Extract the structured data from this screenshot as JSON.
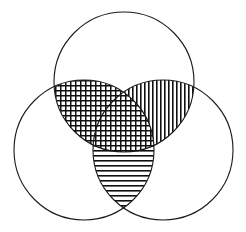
{
  "figure": {
    "width": 246,
    "height": 232,
    "background_color": "#ffffff",
    "stroke_color": "#1a1a1a",
    "stroke_width": 1.1,
    "pattern_color": "#111111"
  },
  "chart_data": {
    "type": "venn",
    "title": "",
    "set_count": 3,
    "background": "#ffffff",
    "circles": [
      {
        "id": "top",
        "label": "A",
        "cx": 124,
        "cy": 82,
        "r": 70,
        "fill": "none",
        "stroke": "#1a1a1a"
      },
      {
        "id": "left",
        "label": "B",
        "cx": 84,
        "cy": 150,
        "r": 70,
        "fill": "none",
        "stroke": "#1a1a1a"
      },
      {
        "id": "right",
        "label": "C",
        "cx": 163,
        "cy": 150,
        "r": 70,
        "fill": "none",
        "stroke": "#1a1a1a"
      }
    ],
    "regions": [
      {
        "id": "top-left-lens",
        "sets": [
          "top",
          "left"
        ],
        "label": "A ∩ B",
        "pattern": "crosshatch",
        "pattern_spacing": 5,
        "pattern_line_width": 1.5,
        "color": "#111111",
        "shaded": true
      },
      {
        "id": "top-right-lens",
        "sets": [
          "top",
          "right"
        ],
        "label": "A ∩ C",
        "pattern": "vertical-lines",
        "pattern_spacing": 4,
        "pattern_line_width": 1.6,
        "color": "#111111",
        "shaded": true
      },
      {
        "id": "left-right-lens",
        "sets": [
          "left",
          "right"
        ],
        "label": "B ∩ C",
        "pattern": "horizontal-lines",
        "pattern_spacing": 5,
        "pattern_line_width": 1.6,
        "color": "#111111",
        "shaded": true
      },
      {
        "id": "center-triple",
        "sets": [
          "top",
          "left",
          "right"
        ],
        "label": "A ∩ B ∩ C",
        "pattern": "crosshatch",
        "pattern_spacing": 5,
        "pattern_line_width": 1.5,
        "color": "#111111",
        "shaded": true
      },
      {
        "id": "top-only",
        "sets": [
          "top"
        ],
        "label": "A only",
        "pattern": "none",
        "color": "#ffffff",
        "shaded": false
      },
      {
        "id": "left-only",
        "sets": [
          "left"
        ],
        "label": "B only",
        "pattern": "none",
        "color": "#ffffff",
        "shaded": false
      },
      {
        "id": "right-only",
        "sets": [
          "right"
        ],
        "label": "C only",
        "pattern": "none",
        "color": "#ffffff",
        "shaded": false
      }
    ],
    "annotations": [],
    "legend": {
      "visible": false,
      "entries": []
    },
    "axis": {
      "visible": false
    }
  }
}
